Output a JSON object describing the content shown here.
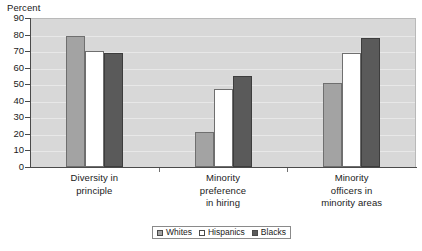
{
  "axis_title": "Percent",
  "chart_data": {
    "type": "bar",
    "title": "",
    "subtitle": "",
    "xlabel": "",
    "ylabel": "Percent",
    "ylim": [
      0,
      90
    ],
    "y_ticks": [
      90,
      80,
      70,
      60,
      50,
      40,
      30,
      20,
      10,
      0
    ],
    "grid": true,
    "legend_position": "bottom",
    "categories": [
      "Diversity in principle",
      "Minority preference in hiring",
      "Minority officers in minority areas"
    ],
    "category_lines": [
      [
        "Diversity in",
        "principle"
      ],
      [
        "Minority",
        "preference",
        "in hiring"
      ],
      [
        "Minority",
        "officers in",
        "minority areas"
      ]
    ],
    "series": [
      {
        "name": "Whites",
        "color": "#a3a3a3",
        "values": [
          79,
          21,
          51
        ]
      },
      {
        "name": "Hispanics",
        "color": "#ffffff",
        "values": [
          70,
          47,
          69
        ]
      },
      {
        "name": "Blacks",
        "color": "#5a5a5a",
        "values": [
          69,
          55,
          78
        ]
      }
    ]
  },
  "legend": {
    "items": [
      {
        "label": "Whites"
      },
      {
        "label": "Hispanics"
      },
      {
        "label": "Blacks"
      }
    ]
  }
}
